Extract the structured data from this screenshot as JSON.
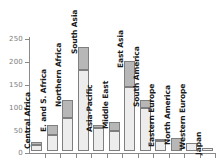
{
  "chart_data": {
    "type": "bar",
    "subtype": "stacked-bar",
    "title": "",
    "subtitle": "",
    "xlabel": "",
    "ylabel": "",
    "ylim": [
      0,
      250
    ],
    "yticks": [
      0,
      50,
      100,
      150,
      200,
      250
    ],
    "ytick_labels": [
      "0",
      "50",
      "100",
      "150",
      "200",
      "250"
    ],
    "grid": false,
    "legend": "none",
    "orientation": "vertical",
    "label_rotation": -90,
    "colors": {
      "lower_segment": "#ededed",
      "upper_segment": "#b7b7b7",
      "bar_outline": "#7f7f7f",
      "axis": "#8a8a8a",
      "tick_text": "#7d7d7d",
      "category_text": "#1a1a1a",
      "background": "#ffffff"
    },
    "categories": [
      "Central Africa",
      "E. and S. Africa",
      "Northern Africa",
      "South Asia",
      "Asia-Pacific",
      "Middle East",
      "East Asia",
      "South America",
      "Eastern Europe",
      "North America",
      "Western Europe",
      "Japan"
    ],
    "series": [
      {
        "name": "lower",
        "values": [
          14,
          35,
          72,
          178,
          50,
          44,
          141,
          95,
          22,
          0,
          18,
          6
        ]
      },
      {
        "name": "upper",
        "values": [
          6,
          22,
          40,
          50,
          7,
          19,
          56,
          17,
          3,
          28,
          0,
          0
        ]
      }
    ],
    "totals": [
      20,
      57,
      112,
      228,
      57,
      63,
      197,
      112,
      25,
      28,
      18,
      6
    ]
  }
}
